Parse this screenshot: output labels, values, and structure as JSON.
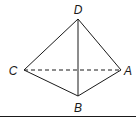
{
  "diagram": {
    "type": "tetrahedron",
    "vertices": {
      "D": {
        "label": "D",
        "x": 78,
        "y": 19,
        "lx": 78,
        "ly": 14
      },
      "C": {
        "label": "C",
        "x": 24,
        "y": 70,
        "lx": 13,
        "ly": 75
      },
      "A": {
        "label": "A",
        "x": 121,
        "y": 70,
        "lx": 128,
        "ly": 75
      },
      "B": {
        "label": "B",
        "x": 78,
        "y": 96,
        "lx": 78,
        "ly": 112
      }
    },
    "edges": [
      {
        "from": "D",
        "to": "C",
        "style": "solid"
      },
      {
        "from": "D",
        "to": "A",
        "style": "solid"
      },
      {
        "from": "D",
        "to": "B",
        "style": "solid"
      },
      {
        "from": "C",
        "to": "B",
        "style": "solid"
      },
      {
        "from": "B",
        "to": "A",
        "style": "solid"
      },
      {
        "from": "C",
        "to": "A",
        "style": "dashed"
      }
    ],
    "colors": {
      "stroke": "#1a1a1a",
      "background": "#ffffff"
    }
  }
}
